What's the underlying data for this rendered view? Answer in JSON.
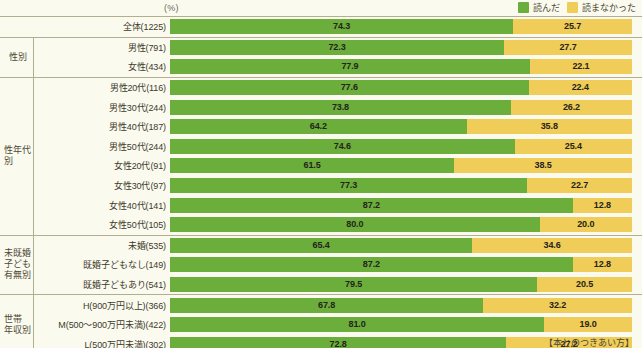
{
  "header": {
    "unit_label": "(%)",
    "legend": [
      {
        "name": "read-legend",
        "label": "読んだ",
        "color": "#6cae3c"
      },
      {
        "name": "unread-legend",
        "label": "読まなかった",
        "color": "#f0cd58"
      }
    ]
  },
  "footnote": "【本とのつきあい方】",
  "colors": {
    "read": "#6cae3c",
    "unread": "#f0cd58",
    "background": "#fbfaef",
    "rule": "#b4ae91",
    "text": "#3d3a2c"
  },
  "chart_data": {
    "type": "bar",
    "orientation": "horizontal",
    "stacked": true,
    "normalized": true,
    "title": "",
    "xlabel": "(%)",
    "ylabel": "",
    "xlim": [
      0,
      100
    ],
    "grid": false,
    "legend_position": "top-right",
    "series": [
      {
        "name": "読んだ",
        "color": "#6cae3c"
      },
      {
        "name": "読まなかった",
        "color": "#f0cd58"
      }
    ],
    "groups": [
      {
        "group_label": "",
        "group_label_lines": [],
        "rows": [
          {
            "category": "全体",
            "n": 1225,
            "label": "全体(1225)",
            "values": [
              74.3,
              25.7
            ]
          }
        ]
      },
      {
        "group_label": "性別",
        "group_label_lines": [
          "性別"
        ],
        "rows": [
          {
            "category": "男性",
            "n": 791,
            "label": "男性(791)",
            "values": [
              72.3,
              27.7
            ]
          },
          {
            "category": "女性",
            "n": 434,
            "label": "女性(434)",
            "values": [
              77.9,
              22.1
            ]
          }
        ]
      },
      {
        "group_label": "性年代別",
        "group_label_lines": [
          "性年代",
          "別"
        ],
        "rows": [
          {
            "category": "男性20代",
            "n": 116,
            "label": "男性20代(116)",
            "values": [
              77.6,
              22.4
            ]
          },
          {
            "category": "男性30代",
            "n": 244,
            "label": "男性30代(244)",
            "values": [
              73.8,
              26.2
            ]
          },
          {
            "category": "男性40代",
            "n": 187,
            "label": "男性40代(187)",
            "values": [
              64.2,
              35.8
            ]
          },
          {
            "category": "男性50代",
            "n": 244,
            "label": "男性50代(244)",
            "values": [
              74.6,
              25.4
            ]
          },
          {
            "category": "女性20代",
            "n": 91,
            "label": "女性20代(91)",
            "values": [
              61.5,
              38.5
            ]
          },
          {
            "category": "女性30代",
            "n": 97,
            "label": "女性30代(97)",
            "values": [
              77.3,
              22.7
            ]
          },
          {
            "category": "女性40代",
            "n": 141,
            "label": "女性40代(141)",
            "values": [
              87.2,
              12.8
            ]
          },
          {
            "category": "女性50代",
            "n": 105,
            "label": "女性50代(105)",
            "values": [
              80.0,
              20.0
            ]
          }
        ]
      },
      {
        "group_label": "未既婚子ども有無別",
        "group_label_lines": [
          "未既婚",
          "子ども",
          "有無別"
        ],
        "rows": [
          {
            "category": "未婚",
            "n": 535,
            "label": "未婚(535)",
            "values": [
              65.4,
              34.6
            ]
          },
          {
            "category": "既婚子どもなし",
            "n": 149,
            "label": "既婚子どもなし(149)",
            "values": [
              87.2,
              12.8
            ]
          },
          {
            "category": "既婚子どもあり",
            "n": 541,
            "label": "既婚子どもあり(541)",
            "values": [
              79.5,
              20.5
            ]
          }
        ]
      },
      {
        "group_label": "世帯年収別",
        "group_label_lines": [
          "世帯",
          "年収別"
        ],
        "rows": [
          {
            "category": "H(900万円以上)",
            "n": 366,
            "label": "H(900万円以上)(366)",
            "values": [
              67.8,
              32.2
            ]
          },
          {
            "category": "M(500〜900万円未満)",
            "n": 422,
            "label": "M(500〜900万円未満)(422)",
            "values": [
              81.0,
              19.0
            ]
          },
          {
            "category": "L(500万円未満)",
            "n": 302,
            "label": "L(500万円未満)(302)",
            "values": [
              72.8,
              27.2
            ]
          }
        ]
      }
    ]
  }
}
